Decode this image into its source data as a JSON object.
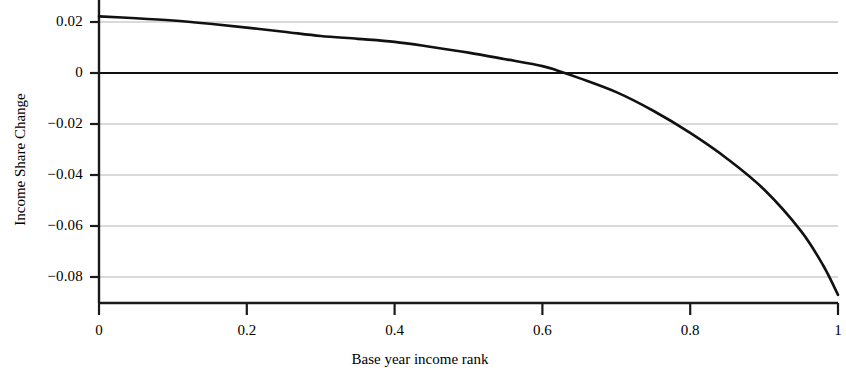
{
  "chart_data": {
    "type": "line",
    "title": "",
    "xlabel": "Base year income rank",
    "ylabel": "Income Share Change",
    "xlim": [
      0,
      1
    ],
    "ylim": [
      -0.092,
      0.026
    ],
    "xticks": [
      "0",
      "0.2",
      "0.4",
      "0.6",
      "0.8",
      "1"
    ],
    "xtick_values": [
      0,
      0.2,
      0.4,
      0.6,
      0.8,
      1
    ],
    "yticks": [
      "0.02",
      "0",
      "−0.02",
      "−0.04",
      "−0.06",
      "−0.08"
    ],
    "ytick_values": [
      0.02,
      0,
      -0.02,
      -0.04,
      -0.06,
      -0.08
    ],
    "grid": "horizontal",
    "legend": "none",
    "zero_line": 0,
    "series": [
      {
        "name": "Income share change",
        "color": "#111111",
        "x": [
          0.0,
          0.05,
          0.1,
          0.15,
          0.2,
          0.25,
          0.3,
          0.35,
          0.4,
          0.45,
          0.5,
          0.55,
          0.6,
          0.62,
          0.65,
          0.7,
          0.75,
          0.8,
          0.85,
          0.9,
          0.95,
          0.98,
          1.0
        ],
        "y": [
          0.0222,
          0.0215,
          0.0206,
          0.0193,
          0.0178,
          0.0162,
          0.0145,
          0.0134,
          0.0122,
          0.0102,
          0.008,
          0.0054,
          0.0027,
          0.001,
          -0.002,
          -0.0075,
          -0.0148,
          -0.0235,
          -0.0336,
          -0.0457,
          -0.062,
          -0.0755,
          -0.087
        ]
      }
    ],
    "zero_crossing_x": 0.625,
    "start_value": 0.0222,
    "end_value": -0.087
  },
  "axes": {
    "y_tick_labels": [
      {
        "text": "0.02",
        "value": 0.02
      },
      {
        "text": "0",
        "value": 0
      },
      {
        "text": "−0.02",
        "value": -0.02
      },
      {
        "text": "−0.04",
        "value": -0.04
      },
      {
        "text": "−0.06",
        "value": -0.06
      },
      {
        "text": "−0.08",
        "value": -0.08
      }
    ],
    "x_tick_labels": [
      {
        "text": "0",
        "value": 0
      },
      {
        "text": "0.2",
        "value": 0.2
      },
      {
        "text": "0.4",
        "value": 0.4
      },
      {
        "text": "0.6",
        "value": 0.6
      },
      {
        "text": "0.8",
        "value": 0.8
      },
      {
        "text": "1",
        "value": 1
      }
    ]
  },
  "colors": {
    "curve": "#111111",
    "axis": "#1a1a1a",
    "gridline": "#b5b5b5",
    "background": "#ffffff"
  }
}
